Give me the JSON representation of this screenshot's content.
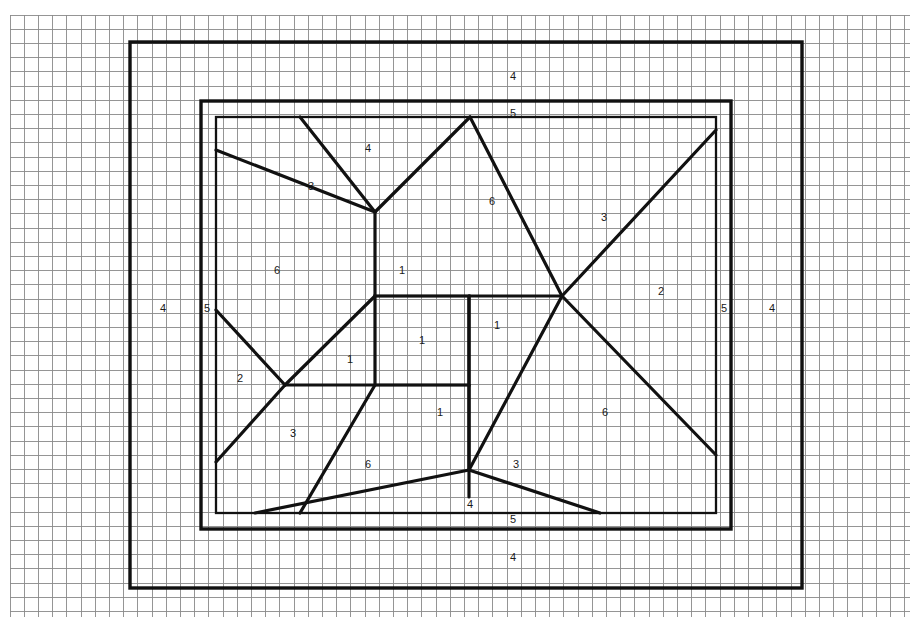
{
  "drawing": {
    "title": "Framed Panel with Diagonal Bracing",
    "medium": "graph paper",
    "background_color": "#ffffff",
    "line_color": "#111111",
    "grid": {
      "enabled": true,
      "minor_color": "#8a8a8a",
      "major_color": "#4a4a4a",
      "cell_size_px": 14.2,
      "major_every": 1,
      "origin_x": 10,
      "origin_y": 15,
      "cols": 64,
      "rows": 43,
      "right_px": 910,
      "bottom_px": 617
    },
    "frame": {
      "outer": {
        "x1": 130,
        "y1": 42,
        "x2": 802,
        "y2": 588
      },
      "inner": {
        "x1": 201,
        "y1": 101,
        "x2": 731,
        "y2": 529
      },
      "panel": {
        "x1": 216,
        "y1": 117,
        "x2": 716,
        "y2": 513
      }
    },
    "nodes": {
      "center_rect": {
        "x1": 375,
        "y1": 296,
        "x2": 469,
        "y2": 385
      },
      "top_hub": {
        "x": 375,
        "y": 212
      },
      "right_hub": {
        "x": 562,
        "y": 296
      },
      "left_hub": {
        "x": 285,
        "y": 385
      },
      "bottom_hub": {
        "x": 469,
        "y": 470
      }
    },
    "part_labels": [
      {
        "id": "p-4-top",
        "text": "4",
        "x": 513,
        "y": 76
      },
      {
        "id": "p-5-top",
        "text": "5",
        "x": 513,
        "y": 113
      },
      {
        "id": "p-4-upper-left",
        "text": "4",
        "x": 368,
        "y": 148
      },
      {
        "id": "p-3-upper-left",
        "text": "3",
        "x": 311,
        "y": 186
      },
      {
        "id": "p-6-upper-mid",
        "text": "6",
        "x": 492,
        "y": 201
      },
      {
        "id": "p-3-upper-right",
        "text": "3",
        "x": 604,
        "y": 217
      },
      {
        "id": "p-6-left",
        "text": "6",
        "x": 277,
        "y": 270
      },
      {
        "id": "p-1-upper",
        "text": "1",
        "x": 402,
        "y": 270
      },
      {
        "id": "p-2-right",
        "text": "2",
        "x": 661,
        "y": 291
      },
      {
        "id": "p-4-left-outer",
        "text": "4",
        "x": 163,
        "y": 308
      },
      {
        "id": "p-5-left",
        "text": "5",
        "x": 207,
        "y": 308
      },
      {
        "id": "p-5-right",
        "text": "5",
        "x": 724,
        "y": 308
      },
      {
        "id": "p-4-right-outer",
        "text": "4",
        "x": 772,
        "y": 308
      },
      {
        "id": "p-1-center-right",
        "text": "1",
        "x": 497,
        "y": 325
      },
      {
        "id": "p-1-center",
        "text": "1",
        "x": 422,
        "y": 340
      },
      {
        "id": "p-1-center-left",
        "text": "1",
        "x": 350,
        "y": 359
      },
      {
        "id": "p-2-left",
        "text": "2",
        "x": 240,
        "y": 378
      },
      {
        "id": "p-1-lower",
        "text": "1",
        "x": 440,
        "y": 412
      },
      {
        "id": "p-6-lower-right",
        "text": "6",
        "x": 605,
        "y": 412
      },
      {
        "id": "p-3-lower-left",
        "text": "3",
        "x": 293,
        "y": 433
      },
      {
        "id": "p-6-lower-left",
        "text": "6",
        "x": 368,
        "y": 464
      },
      {
        "id": "p-3-lower-right",
        "text": "3",
        "x": 516,
        "y": 464
      },
      {
        "id": "p-4-bottom-mid",
        "text": "4",
        "x": 470,
        "y": 504
      },
      {
        "id": "p-5-bottom",
        "text": "5",
        "x": 513,
        "y": 519
      },
      {
        "id": "p-4-bottom",
        "text": "4",
        "x": 513,
        "y": 557
      }
    ],
    "part_legend": [
      {
        "number": "1",
        "role": "central box member"
      },
      {
        "number": "2",
        "role": "short diagonal brace"
      },
      {
        "number": "3",
        "role": "long diagonal brace"
      },
      {
        "number": "4",
        "role": "outer frame rail"
      },
      {
        "number": "5",
        "role": "inner frame rail"
      },
      {
        "number": "6",
        "role": "panel infill field"
      }
    ],
    "chart_data": {
      "type": "diagram",
      "title": "Framed Panel with Diagonal Bracing",
      "grid": true,
      "components": [
        {
          "part": "4",
          "count": 6,
          "description": "outer frame rails (top, bottom, left, right)"
        },
        {
          "part": "5",
          "count": 4,
          "description": "inner frame rails"
        },
        {
          "part": "6",
          "count": 4,
          "description": "panel infill fields"
        },
        {
          "part": "3",
          "count": 4,
          "description": "long diagonal braces"
        },
        {
          "part": "2",
          "count": 2,
          "description": "short diagonal braces"
        },
        {
          "part": "1",
          "count": 6,
          "description": "central box members"
        }
      ],
      "symmetry": "2-fold rotational about center",
      "xlabel": "",
      "ylabel": ""
    }
  }
}
